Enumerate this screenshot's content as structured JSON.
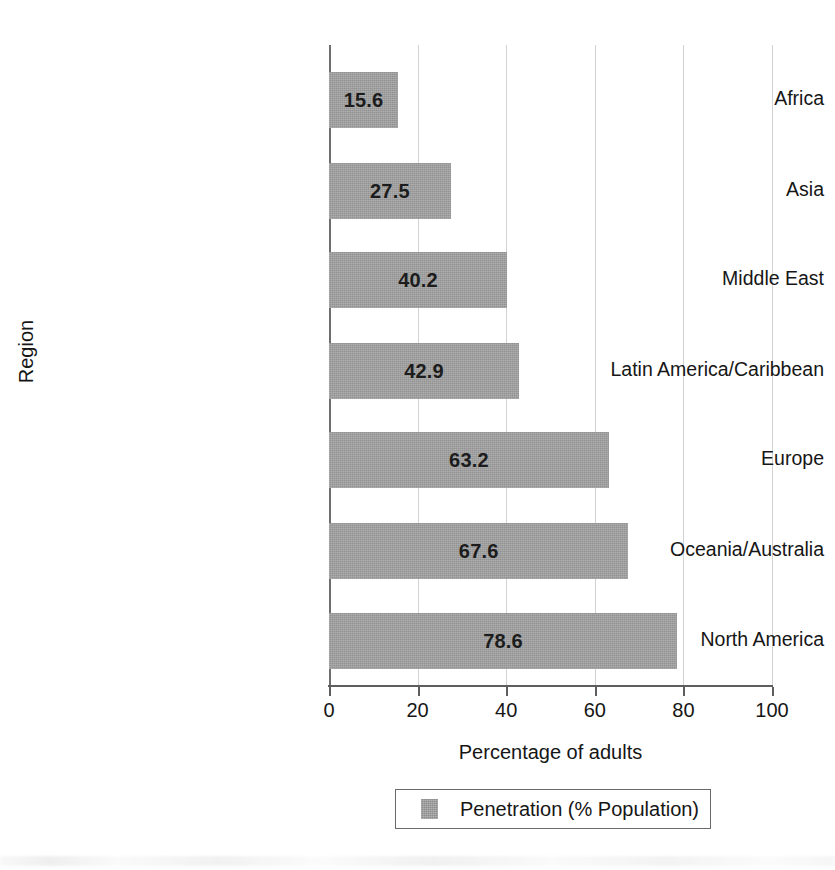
{
  "chart_data": {
    "type": "bar",
    "orientation": "horizontal",
    "title": "",
    "xlabel": "Percentage of adults",
    "ylabel": "Region",
    "xlim": [
      0,
      100
    ],
    "xticks": [
      0,
      20,
      40,
      60,
      80,
      100
    ],
    "xtick_labels": [
      "0",
      "20",
      "40",
      "60",
      "80",
      "100"
    ],
    "grid": "vertical",
    "legend_position": "bottom-center",
    "categories": [
      "Africa",
      "Asia",
      "Middle East",
      "Latin America/Caribbean",
      "Europe",
      "Oceania/Australia",
      "North America"
    ],
    "values": [
      15.6,
      27.5,
      40.2,
      42.9,
      63.2,
      67.6,
      78.6
    ],
    "value_labels": [
      "15.6",
      "27.5",
      "40.2",
      "42.9",
      "63.2",
      "67.6",
      "78.6"
    ],
    "series": [
      {
        "name": "Penetration (% Population)",
        "values": [
          15.6,
          27.5,
          40.2,
          42.9,
          63.2,
          67.6,
          78.6
        ],
        "color": "#a2a2a2"
      }
    ],
    "legend": [
      {
        "label": "Penetration (% Population)",
        "color": "#a2a2a2"
      }
    ],
    "colors": {
      "bar_fill": "#a2a2a2",
      "gridline": "#d2d2d2",
      "axis_line": "#5e5e5e",
      "text": "#161616",
      "background": "#ffffff"
    }
  }
}
